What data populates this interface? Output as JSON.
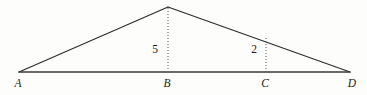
{
  "figure": {
    "canvas": {
      "width": 367,
      "height": 95
    },
    "colors": {
      "background": "#fdfdfb",
      "stroke": "#2b2b2b",
      "baseline_stroke": "#3a3a3a",
      "dotted_stroke": "#555555",
      "text": "#1a1a1a"
    },
    "points": {
      "A": {
        "x": 19,
        "y": 72,
        "label": "A",
        "label_x": 18,
        "label_y": 78
      },
      "B": {
        "x": 168,
        "y": 72,
        "label": "B",
        "label_x": 167,
        "label_y": 78
      },
      "C": {
        "x": 266,
        "y": 72,
        "label": "C",
        "label_x": 265,
        "label_y": 78
      },
      "D": {
        "x": 350,
        "y": 72,
        "label": "D",
        "label_x": 352,
        "label_y": 78
      },
      "apex": {
        "x": 168,
        "y": 7
      }
    },
    "segments": [
      {
        "name": "side-A-apex",
        "from": "A",
        "to": "apex",
        "style": "solid"
      },
      {
        "name": "side-apex-D",
        "from": "apex",
        "to": "D",
        "style": "solid"
      },
      {
        "name": "baseline-A-D",
        "from": "A",
        "to": "D",
        "style": "solid"
      },
      {
        "name": "altitude-apex-B",
        "from": "apex",
        "to": "B",
        "style": "dotted"
      },
      {
        "name": "altitude-hypotenuse-C",
        "from": "hypotenuse",
        "to": "C",
        "style": "dotted"
      }
    ],
    "measures": [
      {
        "name": "altitude-b-length",
        "value": "5",
        "x": 155,
        "y": 44
      },
      {
        "name": "altitude-c-length",
        "value": "2",
        "x": 254,
        "y": 44
      }
    ]
  }
}
